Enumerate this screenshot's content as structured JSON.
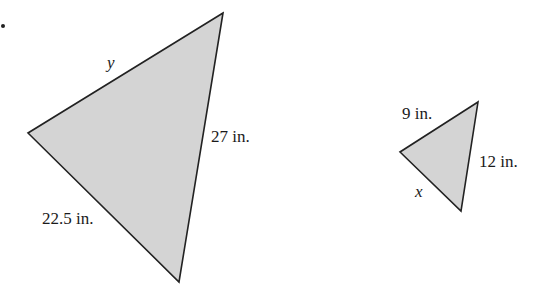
{
  "figure": {
    "bullet": "•",
    "large_triangle": {
      "vertices": [
        [
          223,
          13
        ],
        [
          28,
          133
        ],
        [
          179,
          282
        ]
      ],
      "labels": {
        "top_side": "y",
        "right_side": "27 in.",
        "bottom_side": "22.5 in."
      }
    },
    "small_triangle": {
      "vertices": [
        [
          478,
          102
        ],
        [
          400,
          152
        ],
        [
          461,
          211
        ]
      ],
      "labels": {
        "top_side": "9 in.",
        "right_side": "12 in.",
        "bottom_side": "x"
      }
    },
    "colors": {
      "fill": "#d4d4d4",
      "stroke": "#222222"
    }
  }
}
